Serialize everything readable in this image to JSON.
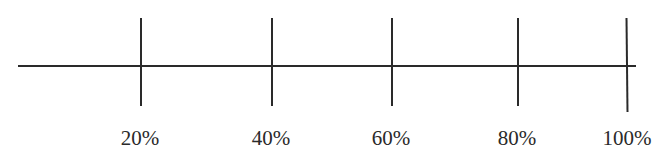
{
  "diagram": {
    "type": "number-line",
    "ticks": [
      {
        "label": "20%",
        "x": 140,
        "top": 18,
        "bottom": 106
      },
      {
        "label": "40%",
        "x": 271,
        "top": 18,
        "bottom": 106
      },
      {
        "label": "60%",
        "x": 391,
        "top": 18,
        "bottom": 106
      },
      {
        "label": "80%",
        "x": 517,
        "top": 18,
        "bottom": 106
      },
      {
        "label": "100%",
        "x": 626,
        "top": 18,
        "bottom": 112
      }
    ]
  }
}
